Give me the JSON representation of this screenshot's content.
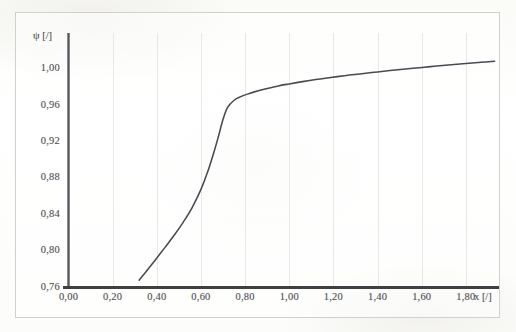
{
  "chart_data": {
    "type": "line",
    "title": "",
    "subtitle": "",
    "xlabel": "x [/]",
    "ylabel": "ψ [/]",
    "xlim": [
      0.0,
      1.95
    ],
    "ylim": [
      0.76,
      1.04
    ],
    "grid": "faint-vertical",
    "legend": "none",
    "line_color": "#4a4a52",
    "x_tick_labels": [
      "0,00",
      "0,20",
      "0,40",
      "0,60",
      "0,80",
      "1,00",
      "1,20",
      "1,40",
      "1,60",
      "1,80"
    ],
    "x_tick_values": [
      0.0,
      0.2,
      0.4,
      0.6,
      0.8,
      1.0,
      1.2,
      1.4,
      1.6,
      1.8
    ],
    "y_tick_labels": [
      "1,00",
      "0,96",
      "0,92",
      "0,88",
      "0,84",
      "0,80",
      "0,76"
    ],
    "y_tick_values": [
      1.0,
      0.96,
      0.92,
      0.88,
      0.84,
      0.8,
      0.76
    ],
    "series": [
      {
        "name": "psi",
        "x": [
          0.32,
          0.36,
          0.4,
          0.44,
          0.48,
          0.52,
          0.56,
          0.6,
          0.63,
          0.66,
          0.68,
          0.7,
          0.72,
          0.75,
          0.78,
          0.82,
          0.86,
          0.9,
          0.95,
          1.0,
          1.06,
          1.12,
          1.18,
          1.25,
          1.32,
          1.4,
          1.48,
          1.56,
          1.64,
          1.72,
          1.8,
          1.87,
          1.93
        ],
        "y": [
          0.768,
          0.78,
          0.7925,
          0.805,
          0.818,
          0.832,
          0.848,
          0.868,
          0.887,
          0.91,
          0.927,
          0.945,
          0.958,
          0.966,
          0.97,
          0.9735,
          0.9765,
          0.979,
          0.9818,
          0.984,
          0.9865,
          0.9888,
          0.9908,
          0.993,
          0.995,
          0.9972,
          0.9993,
          1.0012,
          1.003,
          1.0048,
          1.0064,
          1.0078,
          1.009
        ]
      }
    ]
  },
  "axes": {
    "y_axis_label": "ψ [/]",
    "x_axis_label": "x [/]"
  }
}
